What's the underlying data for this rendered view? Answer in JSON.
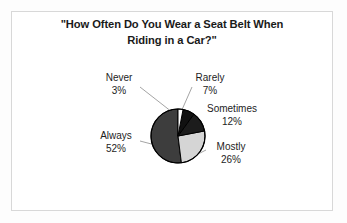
{
  "chart_data": {
    "type": "pie",
    "title": "\"How Often Do You Wear a Seat Belt When Riding in a Car?\"",
    "title_lines": [
      "\"How Often Do You Wear a Seat Belt When",
      "Riding in a Car?\""
    ],
    "xlabel": "",
    "ylabel": "",
    "legend": "none",
    "grid": false,
    "labels_show_percent": true,
    "start_angle_deg": 0,
    "direction": "clockwise",
    "categories": [
      "Never",
      "Rarely",
      "Sometimes",
      "Mostly",
      "Always"
    ],
    "values": [
      3,
      7,
      12,
      26,
      52
    ],
    "units": "percent",
    "slices": [
      {
        "label": "Never",
        "value": 3,
        "percent": "3%",
        "color": "#ffffff",
        "start_deg": 0,
        "end_deg": 10.8
      },
      {
        "label": "Rarely",
        "value": 7,
        "percent": "7%",
        "color": "#111111",
        "start_deg": 10.8,
        "end_deg": 36.0
      },
      {
        "label": "Sometimes",
        "value": 12,
        "percent": "12%",
        "color": "#1c1c1c",
        "start_deg": 36.0,
        "end_deg": 79.2
      },
      {
        "label": "Mostly",
        "value": 26,
        "percent": "26%",
        "color": "#d5d5d5",
        "start_deg": 79.2,
        "end_deg": 172.8
      },
      {
        "label": "Always",
        "value": 52,
        "percent": "52%",
        "color": "#3d3d3d",
        "start_deg": 172.8,
        "end_deg": 360.0
      }
    ]
  },
  "chart": {
    "title_line_1": "\"How Often Do You Wear a Seat Belt When",
    "title_line_2": "Riding in a Car?\"",
    "labels": {
      "never": {
        "name": "Never",
        "percent": "3%"
      },
      "rarely": {
        "name": "Rarely",
        "percent": "7%"
      },
      "sometimes": {
        "name": "Sometimes",
        "percent": "12%"
      },
      "mostly": {
        "name": "Mostly",
        "percent": "26%"
      },
      "always": {
        "name": "Always",
        "percent": "52%"
      }
    },
    "colors": {
      "never": "#ffffff",
      "rarely": "#111111",
      "sometimes": "#1c1c1c",
      "mostly": "#d5d5d5",
      "always": "#3d3d3d",
      "outline": "#000000",
      "frame": "#d8d8d8",
      "background": "#ffffff",
      "text": "#1d1d1d",
      "leader_line": "#9a9a9a"
    }
  }
}
